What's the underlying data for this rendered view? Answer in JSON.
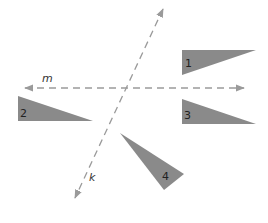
{
  "diagram": {
    "colors": {
      "triangle_fill": "#8a8a8a",
      "line_stroke": "#9a9a9a",
      "label_text": "#222222"
    },
    "lines": {
      "m": {
        "label": "m"
      },
      "k": {
        "label": "k"
      }
    },
    "triangles": [
      {
        "label": "1"
      },
      {
        "label": "2"
      },
      {
        "label": "3"
      },
      {
        "label": "4"
      }
    ]
  }
}
